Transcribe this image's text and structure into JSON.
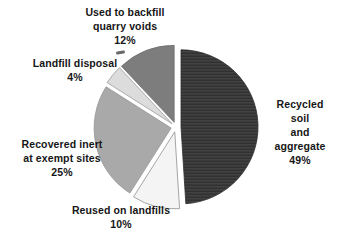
{
  "figure": {
    "background": "#ffffff",
    "text_color": "#161616"
  },
  "chart_data": {
    "type": "pie",
    "title": "",
    "unit": "%",
    "direction": "clockwise",
    "start_angle_deg": 0,
    "explode_px": 5,
    "center_x": 176,
    "center_y": 127,
    "radius": 77,
    "legend": "none",
    "slices": [
      {
        "label": "Recycled soil and aggregate",
        "value": 49,
        "color": "#3a3a3a",
        "stroke": "#2e2e2e",
        "textured": true
      },
      {
        "label": "Reused on landfills",
        "value": 10,
        "color": "#f4f4f4",
        "stroke": "#8f8f8f",
        "textured": false
      },
      {
        "label": "Recovered inert at exempt sites",
        "value": 25,
        "color": "#a9a9a9",
        "stroke": "#949494",
        "textured": false
      },
      {
        "label": "Landfill disposal",
        "value": 4,
        "color": "#dcdcdc",
        "stroke": "#9a9a9a",
        "textured": false
      },
      {
        "label": "Used to backfill quarry voids",
        "value": 12,
        "color": "#7d7d7d",
        "stroke": "#6f6f6f",
        "textured": false
      }
    ],
    "labels": {
      "backfill": {
        "text": "Used to backfill\nquarry voids\n12%"
      },
      "landfill": {
        "text": "Landfill disposal\n4%"
      },
      "recovered": {
        "text": "Recovered inert\nat exempt sites\n25%"
      },
      "reused": {
        "text": "Reused on landfills\n10%"
      },
      "recycled": {
        "text": "Recycled soil\nand aggregate\n49%"
      }
    }
  }
}
